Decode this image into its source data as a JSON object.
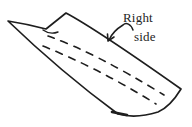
{
  "canvas": {
    "background_color": "#ffffff",
    "width": 192,
    "height": 127
  },
  "illustration": {
    "subject": "folded-paper-strip",
    "style": "hand-drawn ink line sketch",
    "ink_color": "#1e1e1e",
    "fold_lines": "two dashed fold lines running along the strip"
  },
  "annotation": {
    "full_text": "Right side",
    "line1": "Right",
    "line2": "side",
    "pointer": "curved arrow from label to top edge of paper"
  }
}
